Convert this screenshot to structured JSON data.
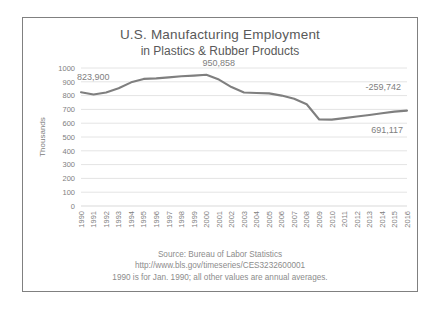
{
  "chart_data": {
    "type": "line",
    "title": "U.S. Manufacturing Employment",
    "subtitle": "in Plastics & Rubber Products",
    "xlabel": "",
    "ylabel": "Thousands",
    "ylim": [
      0,
      1000
    ],
    "ytick_step": 100,
    "yticks": [
      "1000",
      "900",
      "800",
      "700",
      "600",
      "500",
      "400",
      "300",
      "200",
      "100",
      "0"
    ],
    "grid": true,
    "legend": "none",
    "line_color": "#7f7f7f",
    "categories": [
      "1990",
      "1991",
      "1992",
      "1993",
      "1994",
      "1995",
      "1996",
      "1997",
      "1998",
      "1999",
      "2000",
      "2001",
      "2002",
      "2003",
      "2004",
      "2005",
      "2006",
      "2007",
      "2008",
      "2009",
      "2010",
      "2011",
      "2012",
      "2013",
      "2014",
      "2015",
      "2016"
    ],
    "values": [
      823.9,
      808.0,
      823.0,
      853.0,
      896.0,
      921.0,
      925.0,
      932.0,
      940.0,
      945.0,
      950.858,
      916.0,
      862.0,
      823.0,
      819.0,
      816.0,
      800.0,
      777.0,
      737.0,
      627.0,
      626.0,
      637.0,
      648.0,
      659.0,
      672.0,
      684.0,
      691.117
    ],
    "annotations": [
      {
        "name": "start-value-label",
        "text": "823,900",
        "category": "1990",
        "value": 823.9
      },
      {
        "name": "peak-value-label",
        "text": "950,858",
        "category": "2000",
        "value": 950.858
      },
      {
        "name": "net-change-label",
        "text": "-259,742",
        "value": -259.742
      },
      {
        "name": "end-value-label",
        "text": "691,117",
        "category": "2016",
        "value": 691.117
      }
    ],
    "footnotes": [
      "Source: Bureau of Labor Statistics",
      "http://www.bls.gov/timeseries/CES3232600001",
      "1990 is for Jan. 1990; all other values are annual averages."
    ]
  }
}
